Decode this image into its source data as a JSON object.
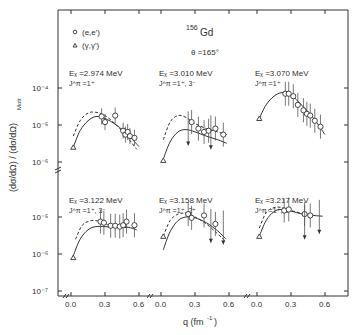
{
  "chart_data": {
    "type": "scatter",
    "nucleus_mass": "156",
    "nucleus_symbol": "Gd",
    "angle_label": "θ =165°",
    "xlabel": "q (fm⁻¹)",
    "ylabel": "(dσ/dΩ) / (dσ/dΩ)Mott",
    "yscale": "log",
    "legend": [
      {
        "marker": "circle",
        "label": "(e,e')"
      },
      {
        "marker": "triangle",
        "label": "(γ,γ')"
      }
    ],
    "x_ticks": [
      "0.0",
      "0.3",
      "0.6"
    ],
    "top_row_y_ticks": [
      "10⁻⁴",
      "10⁻⁵",
      "10⁻⁶"
    ],
    "bottom_row_y_ticks": [
      "10⁻⁵",
      "10⁻⁶",
      "10⁻⁷"
    ],
    "panels": [
      {
        "ex_label": "Eₓ =2.974 MeV",
        "jpi_label": "J^π =1⁺",
        "row": 0,
        "col": 0,
        "gamma": {
          "q": 0.02,
          "y": 2.5e-06
        },
        "ee": [
          {
            "q": 0.27,
            "y": 1.7e-05
          },
          {
            "q": 0.3,
            "y": 1.2e-05
          },
          {
            "q": 0.39,
            "y": 1.8e-05
          },
          {
            "q": 0.46,
            "y": 7e-06
          },
          {
            "q": 0.48,
            "y": 5.5e-06
          },
          {
            "q": 0.5,
            "y": 6.5e-06
          },
          {
            "q": 0.52,
            "y": 5e-06
          },
          {
            "q": 0.56,
            "y": 4.5e-06
          }
        ],
        "solid_curve": [
          [
            0.02,
            2.5e-06
          ],
          [
            0.08,
            7e-06
          ],
          [
            0.15,
            1.3e-05
          ],
          [
            0.22,
            1.7e-05
          ],
          [
            0.3,
            1.5e-05
          ],
          [
            0.4,
            1e-05
          ],
          [
            0.5,
            5.5e-06
          ],
          [
            0.6,
            2.6e-06
          ]
        ],
        "dashed_curve": [
          [
            0.02,
            5e-06
          ],
          [
            0.08,
            1.3e-05
          ],
          [
            0.15,
            2.1e-05
          ],
          [
            0.22,
            2.2e-05
          ],
          [
            0.3,
            1.8e-05
          ],
          [
            0.4,
            1e-05
          ],
          [
            0.5,
            4.5e-06
          ],
          [
            0.58,
            2.2e-06
          ]
        ]
      },
      {
        "ex_label": "Eₓ =3.010 MeV",
        "jpi_label": "J^π =1⁺, 3⁻",
        "row": 0,
        "col": 1,
        "gamma": {
          "q": 0.02,
          "y": 1.1e-06
        },
        "ee": [
          {
            "q": 0.27,
            "y": 1.2e-05
          },
          {
            "q": 0.33,
            "y": 8e-06
          },
          {
            "q": 0.38,
            "y": 6.5e-06
          },
          {
            "q": 0.42,
            "y": 7e-06
          },
          {
            "q": 0.48,
            "y": 8e-06
          },
          {
            "q": 0.55,
            "y": 5.5e-06
          }
        ],
        "solid_curve": [
          [
            0.02,
            1.2e-06
          ],
          [
            0.08,
            3.5e-06
          ],
          [
            0.15,
            6.5e-06
          ],
          [
            0.22,
            7.5e-06
          ],
          [
            0.3,
            6.5e-06
          ],
          [
            0.4,
            5e-06
          ],
          [
            0.5,
            4e-06
          ],
          [
            0.58,
            3.2e-06
          ]
        ],
        "dashed_curve": [
          [
            0.02,
            4e-06
          ],
          [
            0.08,
            1.2e-05
          ],
          [
            0.15,
            1.8e-05
          ],
          [
            0.22,
            1.6e-05
          ],
          [
            0.3,
            1.1e-05
          ],
          [
            0.4,
            8e-06
          ],
          [
            0.5,
            6.5e-06
          ],
          [
            0.58,
            5.5e-06
          ]
        ]
      },
      {
        "ex_label": "Eₓ =3.070 MeV",
        "jpi_label": "J^π =1⁺",
        "row": 0,
        "col": 2,
        "gamma": {
          "q": 0.02,
          "y": 1.5e-05
        },
        "ee": [
          {
            "q": 0.25,
            "y": 7e-05
          },
          {
            "q": 0.28,
            "y": 7e-05
          },
          {
            "q": 0.32,
            "y": 6e-05
          },
          {
            "q": 0.36,
            "y": 3.5e-05
          },
          {
            "q": 0.41,
            "y": 2.5e-05
          },
          {
            "q": 0.44,
            "y": 2e-05
          },
          {
            "q": 0.47,
            "y": 1.8e-05
          },
          {
            "q": 0.51,
            "y": 1.3e-05
          },
          {
            "q": 0.56,
            "y": 9e-06
          }
        ],
        "solid_curve": [
          [
            0.02,
            1.5e-05
          ],
          [
            0.08,
            3.5e-05
          ],
          [
            0.15,
            6e-05
          ],
          [
            0.22,
            7.5e-05
          ],
          [
            0.3,
            6.5e-05
          ],
          [
            0.4,
            3.3e-05
          ],
          [
            0.5,
            1.5e-05
          ],
          [
            0.6,
            5.5e-06
          ]
        ],
        "dashed_curve": []
      },
      {
        "ex_label": "Eₓ =3.122 MeV",
        "jpi_label": "J^π =1⁺, 3⁻",
        "row": 1,
        "col": 0,
        "gamma": {
          "q": 0.02,
          "y": 8e-07
        },
        "ee": [
          {
            "q": 0.26,
            "y": 7.5e-06
          },
          {
            "q": 0.29,
            "y": 7e-06
          },
          {
            "q": 0.35,
            "y": 5.8e-06
          },
          {
            "q": 0.39,
            "y": 5.8e-06
          },
          {
            "q": 0.43,
            "y": 5.5e-06
          },
          {
            "q": 0.46,
            "y": 6e-06
          },
          {
            "q": 0.49,
            "y": 7.5e-06
          },
          {
            "q": 0.56,
            "y": 6e-06
          }
        ],
        "solid_curve": [
          [
            0.02,
            9e-07
          ],
          [
            0.08,
            2.5e-06
          ],
          [
            0.15,
            4.5e-06
          ],
          [
            0.22,
            5.5e-06
          ],
          [
            0.3,
            5.5e-06
          ],
          [
            0.4,
            5.2e-06
          ],
          [
            0.5,
            5.3e-06
          ],
          [
            0.58,
            4.5e-06
          ]
        ],
        "dashed_curve": [
          [
            0.04,
            2.5e-06
          ],
          [
            0.1,
            6e-06
          ],
          [
            0.18,
            8e-06
          ],
          [
            0.26,
            7.5e-06
          ],
          [
            0.34,
            6e-06
          ],
          [
            0.42,
            5.3e-06
          ],
          [
            0.5,
            5.2e-06
          ]
        ]
      },
      {
        "ex_label": "Eₓ =3.158 MeV",
        "jpi_label": "J^π =1⁺, 2⁺",
        "row": 1,
        "col": 1,
        "gamma": {
          "q": 0.02,
          "y": 3e-06
        },
        "ee": [
          {
            "q": 0.24,
            "y": 1.2e-05
          },
          {
            "q": 0.27,
            "y": 9.5e-06
          },
          {
            "q": 0.38,
            "y": 1.1e-05
          },
          {
            "q": 0.48,
            "y": 6.5e-06
          }
        ],
        "solid_curve": [
          [
            0.02,
            1.3e-06
          ],
          [
            0.08,
            4e-06
          ],
          [
            0.15,
            8e-06
          ],
          [
            0.22,
            1e-05
          ],
          [
            0.3,
            9.5e-06
          ],
          [
            0.4,
            7e-06
          ],
          [
            0.5,
            4.2e-06
          ],
          [
            0.57,
            2.6e-06
          ]
        ],
        "dashed_curve": [
          [
            0.02,
            3e-06
          ],
          [
            0.08,
            8e-06
          ],
          [
            0.15,
            1.2e-05
          ],
          [
            0.22,
            1.25e-05
          ],
          [
            0.3,
            1e-05
          ],
          [
            0.4,
            6.5e-06
          ],
          [
            0.5,
            3.5e-06
          ],
          [
            0.57,
            2.2e-06
          ]
        ]
      },
      {
        "ex_label": "Eₓ =3.217 MeV",
        "jpi_label": "J^π =1⁺, 3⁻",
        "row": 1,
        "col": 2,
        "gamma": {
          "q": 0.02,
          "y": 3e-06
        },
        "ee": [
          {
            "q": 0.24,
            "y": 1.5e-05
          },
          {
            "q": 0.28,
            "y": 1.6e-05
          },
          {
            "q": 0.42,
            "y": 1.2e-05
          },
          {
            "q": 0.47,
            "y": 1.1e-05
          }
        ],
        "solid_curve": [
          [
            0.02,
            3e-06
          ],
          [
            0.08,
            8e-06
          ],
          [
            0.15,
            1.4e-05
          ],
          [
            0.22,
            1.6e-05
          ],
          [
            0.3,
            1.45e-05
          ],
          [
            0.4,
            1.2e-05
          ],
          [
            0.5,
            1.1e-05
          ],
          [
            0.58,
            1.05e-05
          ]
        ],
        "dashed_curve": [
          [
            0.02,
            5e-06
          ],
          [
            0.08,
            1.3e-05
          ],
          [
            0.15,
            1.8e-05
          ],
          [
            0.22,
            1.8e-05
          ],
          [
            0.3,
            1.5e-05
          ],
          [
            0.4,
            1.25e-05
          ],
          [
            0.5,
            1.1e-05
          ]
        ]
      }
    ],
    "upper_limit_arrows": [
      {
        "panel": 1,
        "q": 0.24,
        "y": 2.8e-06
      },
      {
        "panel": 1,
        "q": 0.44,
        "y": 2.2e-06
      },
      {
        "panel": 4,
        "q": 0.44,
        "y": 2e-06
      },
      {
        "panel": 4,
        "q": 0.55,
        "y": 1.8e-06
      },
      {
        "panel": 5,
        "q": 0.42,
        "y": 2.5e-06
      },
      {
        "panel": 5,
        "q": 0.55,
        "y": 3.5e-06
      }
    ]
  },
  "legend_text": {
    "ee": "(e,e')",
    "gg": "(γ,γ')"
  },
  "title_mass": "156",
  "title_symbol": "Gd",
  "angle": "θ =165°",
  "x_axis_label": "q (fm",
  "x_axis_label_exp": "-1",
  "x_axis_label_end": ")",
  "y_axis_label": "(dσ/dΩ) / (dσ/dΩ)",
  "y_axis_label_sub": "Mott"
}
